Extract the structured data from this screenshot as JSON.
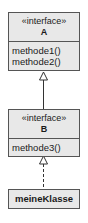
{
  "diagram": {
    "type": "uml-class-diagram",
    "interfaces": [
      {
        "id": "A",
        "stereotype": "«interface»",
        "name": "A",
        "operations": [
          "methode1()",
          "methode2()"
        ]
      },
      {
        "id": "B",
        "stereotype": "«interface»",
        "name": "B",
        "operations": [
          "methode3()"
        ]
      }
    ],
    "classes": [
      {
        "id": "meineKlasse",
        "name": "meineKlasse"
      }
    ],
    "relations": [
      {
        "from": "B",
        "to": "A",
        "kind": "generalization",
        "line": "solid",
        "arrow": "hollow-triangle"
      },
      {
        "from": "meineKlasse",
        "to": "B",
        "kind": "realization",
        "line": "dashed",
        "arrow": "hollow-triangle"
      }
    ],
    "colors": {
      "box_fill": "#e8e8e8",
      "border": "#555555",
      "text": "#1a1a1a"
    }
  }
}
